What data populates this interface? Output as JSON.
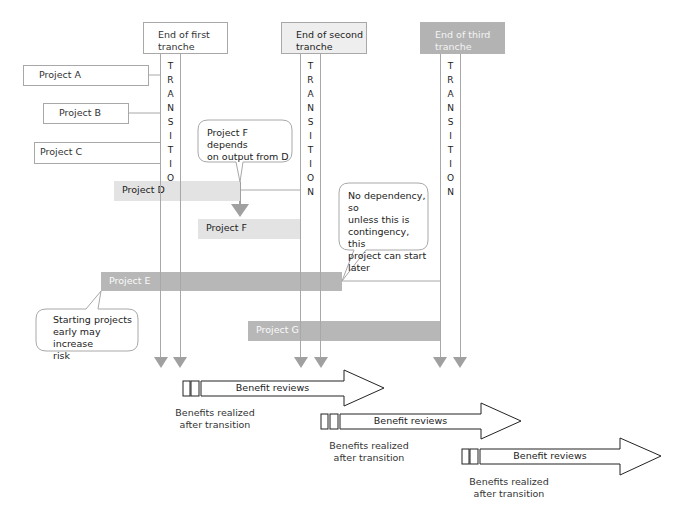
{
  "tranches": [
    {
      "label": "End of first tranche",
      "line1": "End of first",
      "line2": "tranche"
    },
    {
      "label": "End of second tranche",
      "line1": "End of second",
      "line2": "tranche"
    },
    {
      "label": "End of third tranche",
      "line1": "End of third",
      "line2": "tranche"
    }
  ],
  "transition": {
    "letters": [
      "T",
      "R",
      "A",
      "N",
      "S",
      "I",
      "T",
      "I",
      "O",
      "N"
    ]
  },
  "projects": {
    "a": "Project A",
    "b": "Project B",
    "c": "Project C",
    "d": "Project D",
    "e": "Project E",
    "f": "Project F",
    "g": "Project G"
  },
  "callouts": {
    "f_dependency": {
      "line1": "Project F depends",
      "line2": "on output from D"
    },
    "no_dependency": {
      "line1": "No dependency, so",
      "line2": "unless this is",
      "line3": "contingency, this",
      "line4": "project can start",
      "line5": "later"
    },
    "early_risk": {
      "line1": "Starting projects",
      "line2": "early may increase",
      "line3": "risk"
    }
  },
  "benefits": [
    {
      "arrow_label": "Benefit reviews",
      "line1": "Benefits realized",
      "line2": "after transition"
    },
    {
      "arrow_label": "Benefit reviews",
      "line1": "Benefits realized",
      "line2": "after transition"
    },
    {
      "arrow_label": "Benefit reviews",
      "line1": "Benefits realized",
      "line2": "after transition"
    }
  ],
  "colors": {
    "line_gray": "#a8a8a8",
    "arrow_gray": "#a0a0a0",
    "bar_light": "#e3e3e3",
    "bar_dark": "#b7b7b7",
    "tranche3_fill": "#b3b3b3"
  }
}
